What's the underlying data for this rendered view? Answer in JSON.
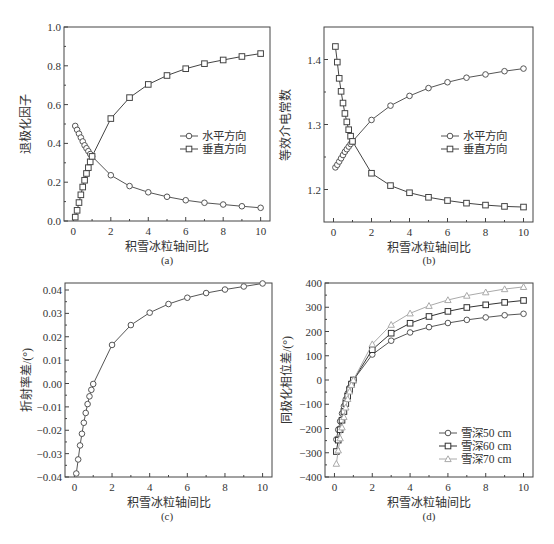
{
  "chart_data": [
    {
      "id": "a",
      "type": "line",
      "caption": "(a)",
      "xlabel": "积雪冰粒轴间比",
      "ylabel": "退极化因子",
      "xlim": [
        -0.5,
        10.5
      ],
      "ylim": [
        0.0,
        1.0
      ],
      "xticks": [
        0,
        2,
        4,
        6,
        8,
        10
      ],
      "yticks": [
        0.0,
        0.2,
        0.4,
        0.6,
        0.8,
        1.0
      ],
      "ytick_labels": [
        "0.0",
        "0.2",
        "0.4",
        "0.6",
        "0.8",
        "1.0"
      ],
      "legend_position": "center-right",
      "box": {
        "left": 64,
        "top": 27,
        "right": 270,
        "bottom": 221
      },
      "legend": {
        "x": 198,
        "y": 136
      },
      "x": [
        0.1,
        0.2,
        0.3,
        0.4,
        0.5,
        0.6,
        0.7,
        0.8,
        0.9,
        1.0,
        2,
        3,
        4,
        5,
        6,
        7,
        8,
        9,
        10
      ],
      "series": [
        {
          "name": "水平方向",
          "marker": "circle",
          "color": "#555555",
          "values": [
            0.49,
            0.47,
            0.45,
            0.43,
            0.41,
            0.39,
            0.375,
            0.36,
            0.345,
            0.333,
            0.236,
            0.18,
            0.148,
            0.125,
            0.107,
            0.094,
            0.085,
            0.076,
            0.068
          ]
        },
        {
          "name": "垂直方向",
          "marker": "square",
          "color": "#444444",
          "values": [
            0.02,
            0.055,
            0.095,
            0.135,
            0.175,
            0.21,
            0.245,
            0.275,
            0.305,
            0.333,
            0.528,
            0.636,
            0.704,
            0.75,
            0.785,
            0.811,
            0.83,
            0.848,
            0.863
          ]
        }
      ]
    },
    {
      "id": "b",
      "type": "line",
      "caption": "(b)",
      "xlabel": "积雪冰粒轴间比",
      "ylabel": "等效介电常数",
      "xlim": [
        -0.5,
        10.5
      ],
      "ylim": [
        1.15,
        1.45
      ],
      "xticks": [
        0,
        2,
        4,
        6,
        8,
        10
      ],
      "yticks": [
        1.2,
        1.3,
        1.4
      ],
      "ytick_labels": [
        "1.2",
        "1.3",
        "1.4"
      ],
      "legend_position": "center-right",
      "box": {
        "left": 324,
        "top": 27,
        "right": 533,
        "bottom": 222
      },
      "legend": {
        "x": 459,
        "y": 136
      },
      "x": [
        0.1,
        0.2,
        0.3,
        0.4,
        0.5,
        0.6,
        0.7,
        0.8,
        0.9,
        1.0,
        2,
        3,
        4,
        5,
        6,
        7,
        8,
        9,
        10
      ],
      "series": [
        {
          "name": "水平方向",
          "marker": "circle",
          "color": "#555555",
          "values": [
            1.234,
            1.238,
            1.243,
            1.248,
            1.253,
            1.258,
            1.262,
            1.266,
            1.27,
            1.274,
            1.307,
            1.329,
            1.344,
            1.356,
            1.365,
            1.372,
            1.377,
            1.382,
            1.386
          ]
        },
        {
          "name": "垂直方向",
          "marker": "square",
          "color": "#444444",
          "values": [
            1.42,
            1.396,
            1.371,
            1.351,
            1.333,
            1.317,
            1.304,
            1.292,
            1.282,
            1.274,
            1.225,
            1.206,
            1.195,
            1.188,
            1.183,
            1.179,
            1.176,
            1.174,
            1.173
          ]
        }
      ]
    },
    {
      "id": "c",
      "type": "line",
      "caption": "(c)",
      "xlabel": "积雪冰粒轴间比",
      "ylabel": "折射率差/(°)",
      "xlim": [
        -0.5,
        10.5
      ],
      "ylim": [
        -0.04,
        0.043
      ],
      "xticks": [
        0,
        2,
        4,
        6,
        8,
        10
      ],
      "yticks": [
        -0.04,
        -0.03,
        -0.02,
        -0.01,
        0.0,
        0.01,
        0.02,
        0.03,
        0.04
      ],
      "ytick_labels": [
        "−0.04",
        "−0.03",
        "−0.02",
        "−0.01",
        "0.00",
        "0.01",
        "0.02",
        "0.03",
        "0.04"
      ],
      "legend_position": "none",
      "box": {
        "left": 65,
        "top": 283,
        "right": 272,
        "bottom": 477
      },
      "x": [
        0.1,
        0.2,
        0.3,
        0.4,
        0.5,
        0.6,
        0.7,
        0.8,
        0.9,
        1.0,
        2,
        3,
        4,
        5,
        6,
        7,
        8,
        9,
        10
      ],
      "series": [
        {
          "name": "折射率差",
          "marker": "circle",
          "color": "#555555",
          "values": [
            -0.0385,
            -0.0325,
            -0.0265,
            -0.0215,
            -0.0168,
            -0.0126,
            -0.0088,
            -0.0055,
            -0.0027,
            -0.0002,
            0.0165,
            0.025,
            0.0303,
            0.034,
            0.0367,
            0.0387,
            0.0402,
            0.0415,
            0.0428
          ]
        }
      ]
    },
    {
      "id": "d",
      "type": "line",
      "caption": "(d)",
      "xlabel": "积雪冰粒轴间比",
      "ylabel": "同极化相位差/(°)",
      "xlim": [
        -0.5,
        10.5
      ],
      "ylim": [
        -400,
        400
      ],
      "xticks": [
        0,
        2,
        4,
        6,
        8,
        10
      ],
      "yticks": [
        -400,
        -300,
        -200,
        -100,
        0,
        100,
        200,
        300,
        400
      ],
      "ytick_labels": [
        "−400",
        "−300",
        "−200",
        "−100",
        "0",
        "100",
        "200",
        "300",
        "400"
      ],
      "legend_position": "lower-right",
      "box": {
        "left": 325,
        "top": 283,
        "right": 533,
        "bottom": 477
      },
      "legend": {
        "x": 457,
        "y": 433
      },
      "x": [
        0.1,
        0.2,
        0.3,
        0.4,
        0.5,
        0.6,
        0.7,
        0.8,
        0.9,
        1.0,
        2,
        3,
        4,
        5,
        6,
        7,
        8,
        9,
        10
      ],
      "series": [
        {
          "name": "雪深50 cm",
          "marker": "circle",
          "color": "#555555",
          "values": [
            -245,
            -205,
            -170,
            -138,
            -108,
            -80,
            -55,
            -32,
            -13,
            0,
            105,
            162,
            196,
            218,
            235,
            248,
            258,
            267,
            273
          ]
        },
        {
          "name": "雪深60 cm",
          "marker": "square",
          "color": "#333333",
          "values": [
            -295,
            -248,
            -205,
            -166,
            -130,
            -97,
            -67,
            -40,
            -17,
            0,
            125,
            193,
            234,
            262,
            283,
            299,
            310,
            320,
            328
          ]
        },
        {
          "name": "雪深70 cm",
          "marker": "triangle",
          "color": "#aaaaaa",
          "values": [
            -345,
            -290,
            -240,
            -195,
            -152,
            -113,
            -78,
            -47,
            -20,
            0,
            148,
            228,
            275,
            306,
            330,
            348,
            362,
            375,
            384
          ]
        }
      ]
    }
  ]
}
